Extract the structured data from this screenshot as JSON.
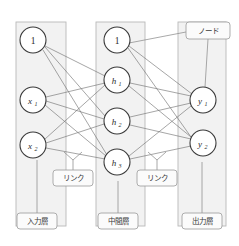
{
  "figure": {
    "type": "neural-network-diagram",
    "title": "",
    "background_color": "#ffffff",
    "panel_fill": "#f2f2f2",
    "panel_stroke": "#b9b9b9",
    "node_fill": "#ffffff",
    "node_stroke": "#3a3a3a",
    "link_stroke": "#6e6e6e",
    "callout_stroke": "#9a9a9a",
    "callout_fill": "#fbfbfb"
  },
  "layers": [
    {
      "id": "input",
      "panel": {
        "x": 16,
        "y": 22,
        "w": 50,
        "h": 204
      },
      "caption": "入力層",
      "caption_box": {
        "x": 17,
        "y": 213,
        "w": 40,
        "h": 16
      },
      "pointer_from_node": "i0",
      "nodes": [
        {
          "id": "i0",
          "label": "1",
          "sub": "",
          "cx": 33,
          "cy": 40,
          "r": 13
        },
        {
          "id": "i1",
          "label": "x",
          "sub": "1",
          "cx": 33,
          "cy": 100,
          "r": 13
        },
        {
          "id": "i2",
          "label": "x",
          "sub": "2",
          "cx": 33,
          "cy": 145,
          "r": 13
        }
      ]
    },
    {
      "id": "hidden",
      "panel": {
        "x": 96,
        "y": 22,
        "w": 49,
        "h": 204
      },
      "caption": "中間層",
      "caption_box": {
        "x": 98,
        "y": 213,
        "w": 40,
        "h": 16
      },
      "pointer_from_node": "h3",
      "nodes": [
        {
          "id": "hb",
          "label": "1",
          "sub": "",
          "cx": 117,
          "cy": 40,
          "r": 13
        },
        {
          "id": "h1",
          "label": "h",
          "sub": "1",
          "cx": 117,
          "cy": 80,
          "r": 13
        },
        {
          "id": "h2",
          "label": "h",
          "sub": "2",
          "cx": 117,
          "cy": 121,
          "r": 13
        },
        {
          "id": "h3",
          "label": "h",
          "sub": "3",
          "cx": 117,
          "cy": 162,
          "r": 13
        }
      ]
    },
    {
      "id": "output",
      "panel": {
        "x": 178,
        "y": 22,
        "w": 48,
        "h": 204
      },
      "caption": "出力層",
      "caption_box": {
        "x": 182,
        "y": 213,
        "w": 40,
        "h": 16
      },
      "pointer_from_node": "y2",
      "nodes": [
        {
          "id": "y1",
          "label": "y",
          "sub": "1",
          "cx": 203,
          "cy": 100,
          "r": 13
        },
        {
          "id": "y2",
          "label": "y",
          "sub": "2",
          "cx": 203,
          "cy": 143,
          "r": 13
        }
      ]
    }
  ],
  "connections": {
    "input_to_hidden": [
      {
        "from": "i0",
        "to": "h1"
      },
      {
        "from": "i0",
        "to": "h2"
      },
      {
        "from": "i0",
        "to": "h3"
      },
      {
        "from": "i1",
        "to": "h1"
      },
      {
        "from": "i1",
        "to": "h2"
      },
      {
        "from": "i1",
        "to": "h3"
      },
      {
        "from": "i2",
        "to": "h1"
      },
      {
        "from": "i2",
        "to": "h2"
      },
      {
        "from": "i2",
        "to": "h3"
      }
    ],
    "hidden_to_output": [
      {
        "from": "hb",
        "to": "y1"
      },
      {
        "from": "hb",
        "to": "y2"
      },
      {
        "from": "h1",
        "to": "y1"
      },
      {
        "from": "h1",
        "to": "y2"
      },
      {
        "from": "h2",
        "to": "y1"
      },
      {
        "from": "h2",
        "to": "y2"
      },
      {
        "from": "h3",
        "to": "y1"
      },
      {
        "from": "h3",
        "to": "y2"
      }
    ]
  },
  "callouts": [
    {
      "id": "node-callout",
      "label": "ノード",
      "box": {
        "x": 186,
        "y": 22,
        "w": 44,
        "h": 17
      },
      "points_to": "y1",
      "also_points_to": "hb"
    },
    {
      "id": "link-callout-1",
      "label": "リンク",
      "box": {
        "x": 53,
        "y": 170,
        "w": 40,
        "h": 16
      },
      "points_to": "input-hidden-links"
    },
    {
      "id": "link-callout-2",
      "label": "リンク",
      "box": {
        "x": 137,
        "y": 170,
        "w": 40,
        "h": 16
      },
      "points_to": "hidden-output-links"
    }
  ]
}
